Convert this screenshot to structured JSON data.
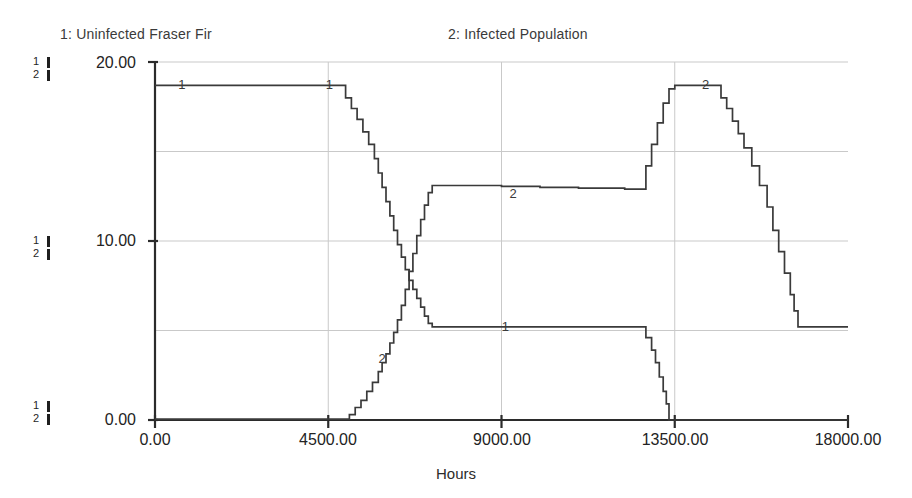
{
  "legend": {
    "series1": "1: Uninfected Fraser Fir",
    "series2": "2: Infected Population"
  },
  "axis": {
    "y_marks": [
      {
        "s1": "1",
        "s2": "2"
      },
      {
        "s1": "1",
        "s2": "2"
      },
      {
        "s1": "1",
        "s2": "2"
      }
    ],
    "y_ticks": [
      "20.00",
      "10.00",
      "0.00"
    ],
    "x_ticks": [
      "0.00",
      "4500.00",
      "9000.00",
      "13500.00",
      "18000.00"
    ],
    "x_title": "Hours"
  },
  "plot_markers": {
    "m1_left": "1",
    "m1_topright": "1",
    "m2_lowleft": "2",
    "m2_plateau": "2",
    "m1_plateau": "1",
    "m2_peak": "2"
  },
  "colors": {
    "line": "#3a3a3a",
    "grid": "#c9c9c9",
    "axis": "#2b2b2b",
    "background": "#ffffff"
  },
  "chart_data": {
    "type": "line",
    "title": "",
    "subtitle": "",
    "xlabel": "Hours",
    "ylabel": "",
    "xlim": [
      0,
      18000
    ],
    "ylim": [
      0,
      20
    ],
    "grid": true,
    "legend_position": "top",
    "xticks": [
      0,
      4500,
      9000,
      13500,
      18000
    ],
    "yticks": [
      0,
      10,
      20
    ],
    "gridlines_y": [
      5,
      10,
      15,
      20
    ],
    "gridlines_x": [
      4500,
      9000,
      13500
    ],
    "step_plot": true,
    "series": [
      {
        "name": "1: Uninfected Fraser Fir",
        "label": "1",
        "x": [
          0,
          4700,
          4950,
          5100,
          5250,
          5400,
          5550,
          5700,
          5800,
          5900,
          6000,
          6100,
          6200,
          6300,
          6400,
          6500,
          6600,
          6700,
          6800,
          6900,
          7000,
          7100,
          7200,
          12600,
          12750,
          12900,
          13000,
          13100,
          13200,
          13280,
          13350,
          18000
        ],
        "y": [
          18.7,
          18.7,
          18.0,
          17.4,
          16.8,
          16.1,
          15.4,
          14.6,
          13.8,
          13.0,
          12.2,
          11.4,
          10.6,
          9.8,
          9.1,
          8.4,
          7.8,
          7.3,
          6.8,
          6.3,
          5.8,
          5.4,
          5.2,
          5.2,
          4.6,
          3.9,
          3.2,
          2.4,
          1.6,
          0.9,
          0.0,
          0.0
        ]
      },
      {
        "name": "2: Infected Population",
        "label": "2",
        "x": [
          0,
          4900,
          5050,
          5200,
          5350,
          5500,
          5650,
          5800,
          5900,
          6000,
          6100,
          6200,
          6300,
          6400,
          6500,
          6600,
          6700,
          6800,
          6900,
          7000,
          7100,
          7200,
          8000,
          9000,
          10000,
          11000,
          12200,
          12600,
          12750,
          12900,
          13050,
          13200,
          13350,
          13500,
          14400,
          14700,
          14850,
          15000,
          15150,
          15300,
          15500,
          15700,
          15900,
          16050,
          16200,
          16350,
          16500,
          16600,
          16700,
          18000
        ],
        "y": [
          0.05,
          0.05,
          0.3,
          0.7,
          1.1,
          1.6,
          2.1,
          2.7,
          3.2,
          3.7,
          4.3,
          4.9,
          5.6,
          6.4,
          7.3,
          8.3,
          9.3,
          10.3,
          11.2,
          12.0,
          12.7,
          13.1,
          13.1,
          13.05,
          13.0,
          12.95,
          12.9,
          12.9,
          14.2,
          15.4,
          16.6,
          17.7,
          18.5,
          18.7,
          18.7,
          18.0,
          17.4,
          16.7,
          16.0,
          15.2,
          14.2,
          13.1,
          11.9,
          10.6,
          9.4,
          8.2,
          7.0,
          6.1,
          5.2,
          5.2
        ]
      }
    ]
  }
}
